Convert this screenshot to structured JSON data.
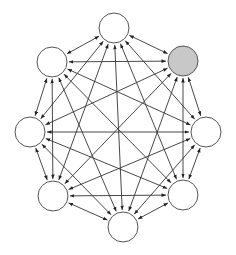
{
  "diagram": {
    "type": "complete-graph",
    "directed": "bidirectional",
    "node_radius": 15,
    "colors": {
      "node_fill": "#ffffff",
      "highlight_fill": "#c8c8c8",
      "node_stroke": "#555555",
      "edge": "#333333",
      "background": "#ffffff"
    },
    "nodes": [
      {
        "id": "top",
        "x": 114,
        "y": 28,
        "highlighted": false
      },
      {
        "id": "upper-right",
        "x": 183,
        "y": 61,
        "highlighted": true
      },
      {
        "id": "right",
        "x": 206,
        "y": 132,
        "highlighted": false
      },
      {
        "id": "lower-right",
        "x": 183,
        "y": 195,
        "highlighted": false
      },
      {
        "id": "bottom",
        "x": 123,
        "y": 227,
        "highlighted": false
      },
      {
        "id": "lower-left",
        "x": 53,
        "y": 196,
        "highlighted": false
      },
      {
        "id": "left",
        "x": 30,
        "y": 132,
        "highlighted": false
      },
      {
        "id": "upper-left",
        "x": 52,
        "y": 62,
        "highlighted": false
      }
    ]
  }
}
